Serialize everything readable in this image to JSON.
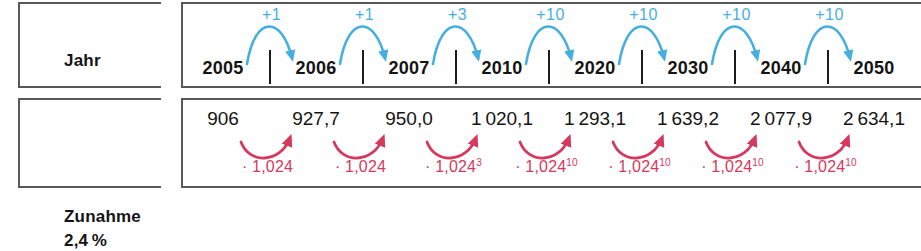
{
  "diagram": {
    "title_hidden": "",
    "colors": {
      "arrow_blue": "#45b0df",
      "arrow_red": "#d6395e",
      "border_gray": "#56585a",
      "text_black": "#141414"
    }
  },
  "row_year": {
    "label": "Jahr",
    "cells": [
      {
        "value": "2005"
      },
      {
        "value": "2006"
      },
      {
        "value": "2007"
      },
      {
        "value": "2010"
      },
      {
        "value": "2020"
      },
      {
        "value": "2030"
      },
      {
        "value": "2040"
      },
      {
        "value": "2050"
      }
    ],
    "deltas": [
      {
        "label": "+1"
      },
      {
        "label": "+1"
      },
      {
        "label": "+3"
      },
      {
        "label": "+10"
      },
      {
        "label": "+10"
      },
      {
        "label": "+10"
      },
      {
        "label": "+10"
      }
    ]
  },
  "row_increase": {
    "label_line1": "Zunahme",
    "label_line2": "2,4 %",
    "cells": [
      {
        "value": "906"
      },
      {
        "value": "927,7"
      },
      {
        "value": "950,0"
      },
      {
        "value": "1 020,1"
      },
      {
        "value": "1 293,1"
      },
      {
        "value": "1 639,2"
      },
      {
        "value": "2 077,9"
      },
      {
        "value": "2 634,1"
      }
    ],
    "factors": [
      {
        "base": "· 1,024",
        "exponent": ""
      },
      {
        "base": "· 1,024",
        "exponent": ""
      },
      {
        "base": "· 1,024",
        "exponent": "3"
      },
      {
        "base": "· 1,024",
        "exponent": "10"
      },
      {
        "base": "· 1,024",
        "exponent": "10"
      },
      {
        "base": "· 1,024",
        "exponent": "10"
      },
      {
        "base": "· 1,024",
        "exponent": "10"
      }
    ]
  },
  "chart_data": {
    "type": "table",
    "categories": [
      "2005",
      "2006",
      "2007",
      "2010",
      "2020",
      "2030",
      "2040",
      "2050"
    ],
    "series": [
      {
        "name": "Zunahme 2,4 %",
        "values": [
          906,
          927.7,
          950.0,
          1020.1,
          1293.1,
          1639.2,
          2077.9,
          2634.1
        ]
      }
    ],
    "year_steps": [
      "+1",
      "+1",
      "+3",
      "+10",
      "+10",
      "+10",
      "+10"
    ],
    "growth_factors": [
      "· 1,024",
      "· 1,024",
      "· 1,024^3",
      "· 1,024^10",
      "· 1,024^10",
      "· 1,024^10",
      "· 1,024^10"
    ],
    "xlabel": "Jahr",
    "ylabel": "Zunahme 2,4 %",
    "grid": false,
    "legend": "none"
  }
}
